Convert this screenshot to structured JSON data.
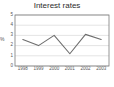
{
  "chart_data": {
    "type": "line",
    "title": "Interest rates",
    "xlabel": "",
    "ylabel": "%",
    "categories": [
      "1998",
      "1999",
      "2000",
      "2001",
      "2002",
      "2003"
    ],
    "x": [
      1998,
      1999,
      2000,
      2001,
      2002,
      2003
    ],
    "values": [
      2.6,
      2.0,
      3.0,
      1.2,
      3.1,
      2.6
    ],
    "series": [
      {
        "name": "Interest rates",
        "values": [
          2.6,
          2.0,
          3.0,
          1.2,
          3.1,
          2.6
        ]
      }
    ],
    "ylim": [
      0,
      5
    ],
    "yticks": [
      0,
      1,
      2,
      3,
      4,
      5
    ],
    "ytick_labels": [
      "0",
      "1",
      "2",
      "3",
      "4",
      "5"
    ],
    "xtick_labels": [
      "1998",
      "1999",
      "2000",
      "2001",
      "2002",
      "2003"
    ],
    "grid": true,
    "grid_axis": "y",
    "legend": false,
    "legend_position": "none",
    "line_color": "#6e6e6e",
    "grid_color": "#d9d9d9",
    "axis_color": "#7a7a7a",
    "background": "#ffffff",
    "text_color": "#555555",
    "title_color": "#2b2b2b"
  }
}
